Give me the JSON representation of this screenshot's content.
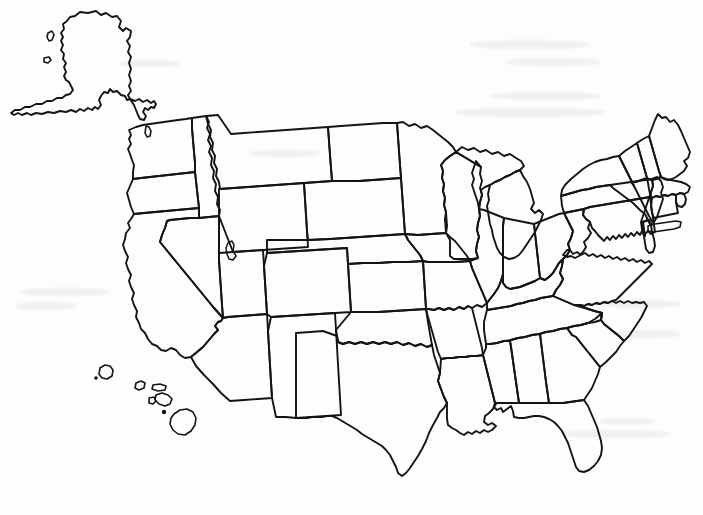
{
  "document": {
    "title": "Blank United States Outline Map",
    "kind": "scanned-outline-map",
    "region": "United States of America",
    "label_text": "",
    "background_color": "#fdfdfc",
    "line_color": "#141414",
    "width": 703,
    "height": 515
  },
  "map": {
    "projection_note": "Alaska inset upper-left, Hawaii inset lower-left",
    "has_state_borders": true,
    "has_labels": false,
    "has_legend": false,
    "has_title_text": false,
    "has_scale_bar": false,
    "has_compass_rose": false,
    "insets": [
      {
        "name": "alaska-inset",
        "label": ""
      },
      {
        "name": "hawaii-inset",
        "label": ""
      }
    ],
    "features": [
      {
        "name": "great-salt-lake",
        "type": "lake",
        "label": ""
      }
    ],
    "states_depicted": [
      "Alabama",
      "Alaska",
      "Arizona",
      "Arkansas",
      "California",
      "Colorado",
      "Connecticut",
      "Delaware",
      "Florida",
      "Georgia",
      "Hawaii",
      "Idaho",
      "Illinois",
      "Indiana",
      "Iowa",
      "Kansas",
      "Kentucky",
      "Louisiana",
      "Maine",
      "Maryland",
      "Massachusetts",
      "Michigan",
      "Minnesota",
      "Mississippi",
      "Missouri",
      "Montana",
      "Nebraska",
      "Nevada",
      "New Hampshire",
      "New Jersey",
      "New Mexico",
      "New York",
      "North Carolina",
      "North Dakota",
      "Ohio",
      "Oklahoma",
      "Oregon",
      "Pennsylvania",
      "Rhode Island",
      "South Carolina",
      "South Dakota",
      "Tennessee",
      "Texas",
      "Utah",
      "Vermont",
      "Virginia",
      "Washington",
      "West Virginia",
      "Wisconsin",
      "Wyoming"
    ],
    "state_count": 50
  }
}
